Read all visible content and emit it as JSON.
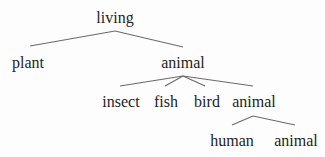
{
  "tree": {
    "root": {
      "label": "living",
      "children": [
        {
          "label": "plant"
        },
        {
          "label": "animal",
          "children": [
            {
              "label": "insect"
            },
            {
              "label": "fish"
            },
            {
              "label": "bird"
            },
            {
              "label": "animal",
              "children": [
                {
                  "label": "human"
                },
                {
                  "label": "animal"
                }
              ]
            }
          ]
        }
      ]
    }
  },
  "nodes": {
    "living": "living",
    "plant": "plant",
    "animal_1": "animal",
    "insect": "insect",
    "fish": "fish",
    "bird": "bird",
    "animal_2": "animal",
    "human": "human",
    "animal_3": "animal"
  }
}
